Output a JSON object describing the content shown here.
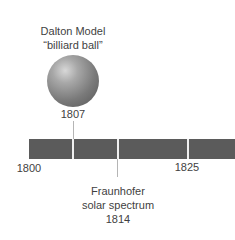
{
  "timeline": {
    "start_year": "1800",
    "mid_year": "1825",
    "bar_color": "#5b5b5b",
    "events": [
      {
        "title_line1": "Dalton Model",
        "title_line2": "“billiard ball”",
        "year": "1807",
        "position": "above",
        "icon": "sphere-icon"
      },
      {
        "title_line1": "Fraunhofer",
        "title_line2": "solar spectrum",
        "year": "1814",
        "position": "below"
      }
    ]
  }
}
